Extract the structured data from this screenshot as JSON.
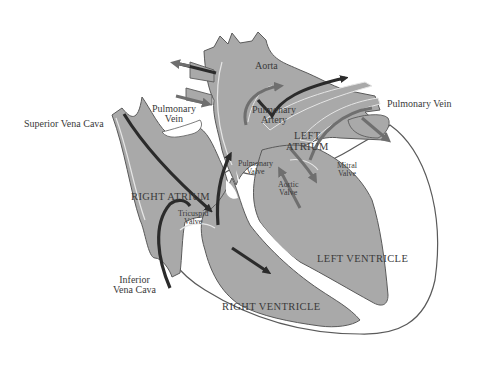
{
  "diagram": {
    "colors": {
      "background": "#ffffff",
      "tissue": "#a9a9a9",
      "tissue_outline": "#5a5a5a",
      "vessel_highlight": "#e6e6e6",
      "deoxygenated_arrow": "#2b2b2b",
      "oxygenated_arrow": "#6f6f6f",
      "label_text": "#3a3a3a"
    },
    "labels": {
      "superior_vena_cava": "Superior Vena Cava",
      "pulmonary_vein_left": [
        "Pulmonary",
        "Vein"
      ],
      "aorta": "Aorta",
      "pulmonary_artery": [
        "Pulmonary",
        "Artery"
      ],
      "pulmonary_vein_right": "Pulmonary Vein",
      "left_atrium": [
        "LEFT",
        "ATRIUM"
      ],
      "pulmonary_valve": [
        "Pulmonary",
        "Valve"
      ],
      "mitral_valve": [
        "Mitral",
        "Valve"
      ],
      "aortic_valve": [
        "Aortic",
        "Valve"
      ],
      "right_atrium": "RIGHT ATRIUM",
      "tricuspid_valve": [
        "Tricuspid",
        "Valve"
      ],
      "left_ventricle": "LEFT VENTRICLE",
      "inferior_vena_cava": [
        "Inferior",
        "Vena Cava"
      ],
      "right_ventricle": "RIGHT VENTRICLE"
    }
  }
}
